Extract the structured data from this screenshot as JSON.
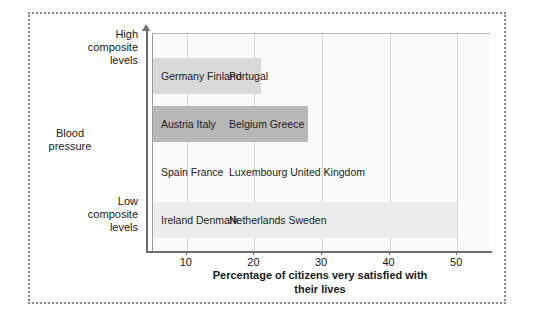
{
  "figure": {
    "frame_style": "dotted-border"
  },
  "chart_data": {
    "type": "bar",
    "orientation": "horizontal",
    "title": "",
    "xlabel": "Percentage of citizens very\nsatisfied with their lives",
    "ylabel": "Blood\npressure",
    "y_axis_top_label": "High\ncomposite\nlevels",
    "y_axis_bottom_label": "Low\ncomposite\nlevels",
    "xlim": [
      5,
      55
    ],
    "xticks": [
      10,
      20,
      30,
      40,
      50
    ],
    "xticklabels": [
      "10",
      "20",
      "30",
      "40",
      "50"
    ],
    "grid": "vertical",
    "legend": "none",
    "categories": [
      "Germany, Finland, Portugal",
      "Austria, Italy, Belgium, Greece",
      "Spain, France, Luxembourg, United Kingdom",
      "Ireland, Denmark, Netherlands, Sweden"
    ],
    "values": [
      21,
      28,
      5,
      50
    ],
    "bars": [
      {
        "index": 0,
        "value": 21,
        "color": "#d9d9d9",
        "countries_col1": [
          "Germany",
          "Finland"
        ],
        "countries_col2": [
          "Portugal"
        ],
        "label_col1": "Germany\nFinland",
        "label_col2": "Portugal"
      },
      {
        "index": 1,
        "value": 28,
        "color": "#b8b8b8",
        "countries_col1": [
          "Austria",
          "Italy"
        ],
        "countries_col2": [
          "Belgium",
          "Greece"
        ],
        "label_col1": "Austria\nItaly",
        "label_col2": "Belgium\nGreece"
      },
      {
        "index": 2,
        "value": 5,
        "color": "#fbfbfb",
        "countries_col1": [
          "Spain",
          "France"
        ],
        "countries_col2": [
          "Luxembourg",
          "United Kingdom"
        ],
        "label_col1": "Spain\nFrance",
        "label_col2": "Luxembourg\nUnited Kingdom"
      },
      {
        "index": 3,
        "value": 50,
        "color": "#ececec",
        "countries_col1": [
          "Ireland",
          "Denmark"
        ],
        "countries_col2": [
          "Netherlands",
          "Sweden"
        ],
        "label_col1": "Ireland\nDenmark",
        "label_col2": "Netherlands\nSweden"
      }
    ],
    "colors": {
      "plot_background": "#fbfbfb",
      "page_background": "#ffffff",
      "axis": "#6e6e6e",
      "gridline": "#d6d6d6",
      "frame": "#8a8a8a",
      "text": "#1a1a1a"
    }
  }
}
